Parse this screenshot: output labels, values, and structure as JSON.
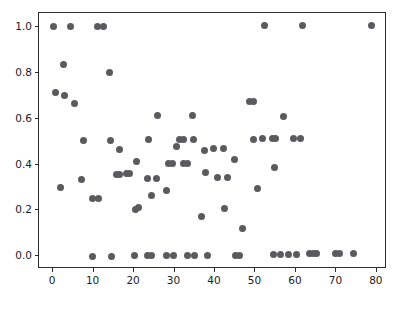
{
  "chart_data": {
    "type": "scatter",
    "title": "",
    "xlabel": "",
    "ylabel": "",
    "xlim": [
      -3.5,
      82.5
    ],
    "ylim": [
      -0.055,
      1.06
    ],
    "grid": false,
    "legend": null,
    "marker": {
      "color": "#5a5a5f",
      "size_px": 7,
      "shape": "circle"
    },
    "xticks": [
      0,
      10,
      20,
      30,
      40,
      50,
      60,
      70,
      80
    ],
    "xtick_labels": [
      "0",
      "10",
      "20",
      "30",
      "40",
      "50",
      "60",
      "70",
      "80"
    ],
    "yticks": [
      0.0,
      0.2,
      0.4,
      0.6,
      0.8,
      1.0
    ],
    "ytick_labels": [
      "0.0",
      "0.2",
      "0.4",
      "0.6",
      "0.8",
      "1.0"
    ],
    "series": [
      {
        "name": "points",
        "points": [
          [
            0.0,
            1.0
          ],
          [
            4.2,
            1.0
          ],
          [
            11.0,
            1.0
          ],
          [
            12.4,
            1.0
          ],
          [
            52.2,
            1.005
          ],
          [
            61.6,
            1.005
          ],
          [
            78.7,
            1.005
          ],
          [
            2.5,
            0.835
          ],
          [
            13.9,
            0.8
          ],
          [
            0.7,
            0.715
          ],
          [
            2.8,
            0.7
          ],
          [
            5.2,
            0.665
          ],
          [
            48.5,
            0.675
          ],
          [
            49.6,
            0.675
          ],
          [
            25.9,
            0.615
          ],
          [
            34.5,
            0.615
          ],
          [
            57.0,
            0.61
          ],
          [
            7.4,
            0.503
          ],
          [
            14.2,
            0.505
          ],
          [
            23.5,
            0.507
          ],
          [
            31.3,
            0.508
          ],
          [
            32.2,
            0.508
          ],
          [
            34.8,
            0.508
          ],
          [
            49.6,
            0.51
          ],
          [
            51.8,
            0.512
          ],
          [
            54.1,
            0.512
          ],
          [
            55.0,
            0.512
          ],
          [
            59.3,
            0.512
          ],
          [
            61.2,
            0.512
          ],
          [
            16.4,
            0.465
          ],
          [
            30.4,
            0.478
          ],
          [
            37.4,
            0.462
          ],
          [
            39.6,
            0.468
          ],
          [
            42.0,
            0.468
          ],
          [
            20.6,
            0.412
          ],
          [
            44.9,
            0.424
          ],
          [
            28.6,
            0.405
          ],
          [
            29.5,
            0.405
          ],
          [
            32.3,
            0.405
          ],
          [
            33.3,
            0.405
          ],
          [
            7.1,
            0.335
          ],
          [
            15.6,
            0.357
          ],
          [
            16.5,
            0.355
          ],
          [
            18.2,
            0.362
          ],
          [
            18.9,
            0.36
          ],
          [
            23.2,
            0.338
          ],
          [
            25.5,
            0.34
          ],
          [
            37.6,
            0.365
          ],
          [
            40.6,
            0.343
          ],
          [
            43.1,
            0.343
          ],
          [
            54.8,
            0.387
          ],
          [
            1.9,
            0.3
          ],
          [
            28.1,
            0.287
          ],
          [
            50.6,
            0.297
          ],
          [
            24.3,
            0.265
          ],
          [
            9.6,
            0.253
          ],
          [
            11.3,
            0.253
          ],
          [
            20.4,
            0.205
          ],
          [
            21.1,
            0.212
          ],
          [
            42.4,
            0.208
          ],
          [
            36.6,
            0.175
          ],
          [
            46.9,
            0.12
          ],
          [
            9.6,
            0.0
          ],
          [
            14.3,
            0.0
          ],
          [
            20.1,
            0.004
          ],
          [
            23.3,
            0.004
          ],
          [
            24.4,
            0.004
          ],
          [
            27.9,
            0.005
          ],
          [
            29.7,
            0.005
          ],
          [
            33.1,
            0.005
          ],
          [
            35.0,
            0.005
          ],
          [
            38.2,
            0.005
          ],
          [
            45.1,
            0.005
          ],
          [
            46.0,
            0.005
          ],
          [
            54.4,
            0.01
          ],
          [
            56.3,
            0.01
          ],
          [
            58.2,
            0.01
          ],
          [
            60.1,
            0.01
          ],
          [
            63.4,
            0.012
          ],
          [
            64.3,
            0.012
          ],
          [
            65.2,
            0.012
          ],
          [
            69.8,
            0.013
          ],
          [
            70.7,
            0.013
          ],
          [
            74.1,
            0.013
          ]
        ]
      }
    ]
  },
  "figure": {
    "background": "#ffffff",
    "axes_color": "#2b2b2b"
  }
}
